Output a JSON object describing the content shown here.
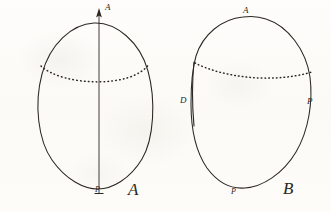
{
  "figure": {
    "caption_a": "A",
    "caption_b": "B",
    "ink_color": "#2b2722",
    "paper_color": "#fdfcfa"
  },
  "panel_a": {
    "name": "A",
    "caption": "A",
    "labels": {
      "apex": "A",
      "pole": "P"
    },
    "axis": {
      "name": "polar-axis",
      "arrow_direction": "up",
      "tick_at_bottom": true
    },
    "equator": {
      "name": "equator",
      "style": "dotted"
    }
  },
  "panel_b": {
    "name": "B",
    "caption": "B",
    "labels": {
      "apex": "A",
      "pole": "P",
      "left": "D",
      "right": "P"
    },
    "equator": {
      "name": "equator",
      "style": "dotted"
    }
  }
}
